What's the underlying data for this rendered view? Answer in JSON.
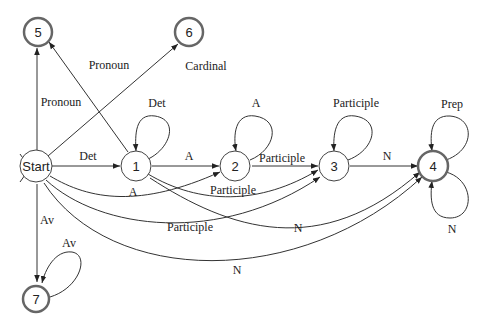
{
  "diagram": {
    "type": "finite-state-automaton",
    "nodes": [
      {
        "id": "start",
        "label": "Start",
        "final": false,
        "start": true
      },
      {
        "id": "1",
        "label": "1",
        "final": false
      },
      {
        "id": "2",
        "label": "2",
        "final": false
      },
      {
        "id": "3",
        "label": "3",
        "final": false
      },
      {
        "id": "4",
        "label": "4",
        "final": true
      },
      {
        "id": "5",
        "label": "5",
        "final": true
      },
      {
        "id": "6",
        "label": "6",
        "final": true
      },
      {
        "id": "7",
        "label": "7",
        "final": true
      }
    ],
    "edges": [
      {
        "from": "start",
        "to": "5",
        "label": "Pronoun"
      },
      {
        "from": "1",
        "to": "5",
        "label": "Pronoun"
      },
      {
        "from": "start",
        "to": "6",
        "label": "Cardinal"
      },
      {
        "from": "start",
        "to": "1",
        "label": "Det"
      },
      {
        "from": "1",
        "to": "1",
        "label": "Det"
      },
      {
        "from": "1",
        "to": "2",
        "label": "A"
      },
      {
        "from": "start",
        "to": "2",
        "label": "A"
      },
      {
        "from": "2",
        "to": "2",
        "label": "A"
      },
      {
        "from": "2",
        "to": "3",
        "label": "Participle"
      },
      {
        "from": "1",
        "to": "3",
        "label": "Participle"
      },
      {
        "from": "start",
        "to": "3",
        "label": "Participle"
      },
      {
        "from": "3",
        "to": "3",
        "label": "Participle"
      },
      {
        "from": "3",
        "to": "4",
        "label": "N"
      },
      {
        "from": "1",
        "to": "4",
        "label": "N"
      },
      {
        "from": "start",
        "to": "4",
        "label": "N"
      },
      {
        "from": "4",
        "to": "4",
        "label": "Prep"
      },
      {
        "from": "4",
        "to": "4",
        "label": "N"
      },
      {
        "from": "start",
        "to": "7",
        "label": "Av"
      },
      {
        "from": "7",
        "to": "7",
        "label": "Av"
      }
    ]
  },
  "labels": {
    "pronoun_start_5": "Pronoun",
    "pronoun_1_5": "Pronoun",
    "cardinal": "Cardinal",
    "det_start_1": "Det",
    "det_loop": "Det",
    "a_1_2": "A",
    "a_start_2": "A",
    "a_loop": "A",
    "participle_2_3": "Participle",
    "participle_1_3": "Participle",
    "participle_start_3": "Participle",
    "participle_loop": "Participle",
    "n_3_4": "N",
    "n_1_4": "N",
    "n_start_4": "N",
    "prep_loop": "Prep",
    "n_loop": "N",
    "av_start_7": "Av",
    "av_loop": "Av"
  },
  "node_labels": {
    "start": "Start",
    "n1": "1",
    "n2": "2",
    "n3": "3",
    "n4": "4",
    "n5": "5",
    "n6": "6",
    "n7": "7"
  }
}
